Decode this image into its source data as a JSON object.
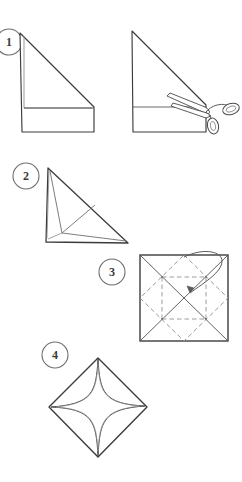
{
  "document": {
    "title": "Paper folding and cutting instructions",
    "background_color": "#ffffff",
    "ink_color": "#3c3c3c",
    "fold_line_color": "#8c8c8c",
    "width": 242,
    "height": 482
  },
  "steps": [
    {
      "number": "1",
      "badge_label": "1",
      "name": "fold-and-cut-step",
      "figures": [
        {
          "name": "folded-triangle",
          "description": "Right triangle of folded paper with a horizontal band along the bottom"
        },
        {
          "name": "triangle-with-scissors",
          "description": "Same triangle with open scissors cutting along the band line"
        }
      ]
    },
    {
      "number": "2",
      "badge_label": "2",
      "name": "trimmed-triangle-step",
      "figures": [
        {
          "name": "trimmed-triangle",
          "description": "Right triangle showing interior fold creases"
        }
      ]
    },
    {
      "number": "3",
      "badge_label": "3",
      "name": "unfolded-square-step",
      "figures": [
        {
          "name": "creased-square",
          "description": "Unfolded square showing solid diagonal creases and dashed valley creases, with a curved arrow folding a corner inward"
        }
      ]
    },
    {
      "number": "4",
      "badge_label": "4",
      "name": "finished-star-step",
      "figures": [
        {
          "name": "star-diamond",
          "description": "Diamond shaped sheet with a four pointed star cut in the center"
        }
      ]
    }
  ]
}
